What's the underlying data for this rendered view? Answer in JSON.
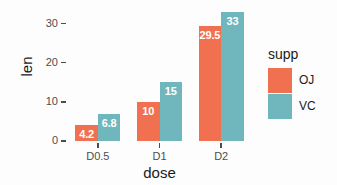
{
  "chart_data": {
    "type": "bar",
    "title": "",
    "xlabel": "dose",
    "ylabel": "len",
    "categories": [
      "D0.5",
      "D1",
      "D2"
    ],
    "series": [
      {
        "name": "OJ",
        "values": [
          4.2,
          10,
          29.5
        ],
        "color": "#F0704F"
      },
      {
        "name": "VC",
        "values": [
          6.8,
          15,
          33
        ],
        "color": "#6FB7BC"
      }
    ],
    "value_labels": {
      "OJ": [
        "4.2",
        "10",
        "29.5"
      ],
      "VC": [
        "6.8",
        "15",
        "33"
      ]
    },
    "ylim": [
      0,
      34.5
    ],
    "yticks": [
      0,
      10,
      20,
      30
    ],
    "ytick_labels": [
      "0",
      "10",
      "20",
      "30"
    ],
    "grid": false,
    "legend": {
      "title": "supp",
      "position": "right",
      "entries": [
        {
          "label": "OJ",
          "color": "#F0704F"
        },
        {
          "label": "VC",
          "color": "#6FB7BC"
        }
      ]
    },
    "bar_label_color": "#FFFFFF",
    "background": "#FDFDFD"
  }
}
